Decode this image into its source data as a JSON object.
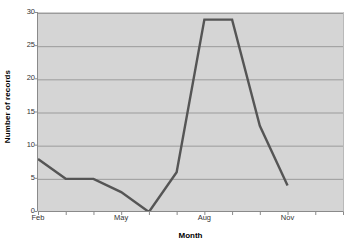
{
  "chart_data": {
    "type": "line",
    "title": "",
    "xlabel": "Month",
    "ylabel": "Number of records",
    "ylim": [
      0,
      30
    ],
    "ytick_values": [
      0,
      5,
      10,
      15,
      20,
      25,
      30
    ],
    "ytick_labels": [
      "0",
      "5",
      "10",
      "15",
      "20",
      "25",
      "30"
    ],
    "grid": true,
    "legend": false,
    "x": [
      "Feb",
      "Mar",
      "Apr",
      "May",
      "Jun",
      "Jul",
      "Aug",
      "Sep",
      "Oct",
      "Nov",
      "Dec",
      "Jan"
    ],
    "xtick_labels": [
      "Feb",
      "",
      "",
      "May",
      "",
      "",
      "Aug",
      "",
      "",
      "Nov"
    ],
    "xtick_labels_visible": [
      "Feb",
      "May",
      "Aug",
      "Nov"
    ],
    "categories": [
      "Feb",
      "Mar",
      "Apr",
      "May",
      "Jun",
      "Jul",
      "Aug",
      "Sep",
      "Oct",
      "Nov"
    ],
    "values": [
      8,
      5,
      5,
      3,
      0,
      6,
      29,
      29,
      13,
      4
    ],
    "series": [
      {
        "name": "Number of records",
        "values": [
          8,
          5,
          5,
          3,
          0,
          6,
          29,
          29,
          13,
          4
        ],
        "color": "#555555"
      }
    ],
    "line_color": "#555555",
    "line_width": 2.4,
    "plot_background": "#d5d5d5",
    "gridline_color": "#9b9b9b",
    "axis_color": "#8a8a8a",
    "page_background": "#ffffff"
  },
  "axis_titles": {
    "y": "Number of records",
    "x": "Month"
  }
}
